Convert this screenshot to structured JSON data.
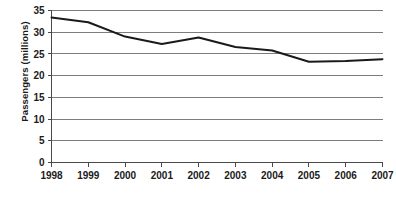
{
  "chart_data": {
    "type": "line",
    "title": "",
    "xlabel": "",
    "ylabel": "Passengers (millions)",
    "categories": [
      "1998",
      "1999",
      "2000",
      "2001",
      "2002",
      "2003",
      "2004",
      "2005",
      "2006",
      "2007"
    ],
    "x": [
      1998,
      1999,
      2000,
      2001,
      2002,
      2003,
      2004,
      2005,
      2006,
      2007
    ],
    "values": [
      33.4,
      32.3,
      29.0,
      27.3,
      28.8,
      26.6,
      25.8,
      23.2,
      23.4,
      23.8
    ],
    "series": [
      {
        "name": "Passengers",
        "values": [
          33.4,
          32.3,
          29.0,
          27.3,
          28.8,
          26.6,
          25.8,
          23.2,
          23.4,
          23.8
        ],
        "color": "#1a1a1a"
      }
    ],
    "ylim": [
      0,
      35
    ],
    "xlim": [
      1998,
      2007
    ],
    "yticks": [
      0,
      5,
      10,
      15,
      20,
      25,
      30,
      35
    ],
    "ytick_labels": [
      "0",
      "5",
      "10",
      "15",
      "20",
      "25",
      "30",
      "35"
    ],
    "xtick_labels": [
      "1998",
      "1999",
      "2000",
      "2001",
      "2002",
      "2003",
      "2004",
      "2005",
      "2006",
      "2007"
    ],
    "grid": true,
    "grid_axis": "y",
    "legend": false,
    "legend_position": "none",
    "line_color": "#1a1a1a",
    "gridline_color": "#7d7d7d",
    "axis_color": "#4a4a4a",
    "background_color": "#ffffff"
  },
  "axis": {
    "y_title": "Passengers (millions)"
  }
}
